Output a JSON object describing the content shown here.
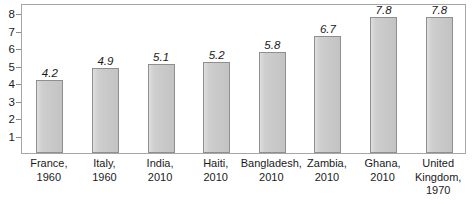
{
  "chart_data": {
    "type": "bar",
    "title": "",
    "subtitle": "",
    "xlabel": "",
    "ylabel": "",
    "ylim": [
      0,
      8.6
    ],
    "yticks": [
      1,
      2,
      3,
      4,
      5,
      6,
      7,
      8
    ],
    "grid": false,
    "legend": null,
    "value_labels_shown": true,
    "value_label_style": "italic",
    "bar_fill_color": "#c9c9c9",
    "bar_border_color": "#8f8f8f",
    "axis_color": "#a6a6a6",
    "text_color": "#1a1a1a",
    "categories": [
      "France, 1960",
      "Italy, 1960",
      "India, 2010",
      "Haiti, 2010",
      "Bangladesh, 2010",
      "Zambia, 2010",
      "Ghana, 2010",
      "United Kingdom, 1970"
    ],
    "category_lines": [
      [
        "France,",
        "1960"
      ],
      [
        "Italy,",
        "1960"
      ],
      [
        "India,",
        "2010"
      ],
      [
        "Haiti,",
        "2010"
      ],
      [
        "Bangladesh,",
        "2010"
      ],
      [
        "Zambia,",
        "2010"
      ],
      [
        "Ghana,",
        "2010"
      ],
      [
        "United",
        "Kingdom,",
        "1970"
      ]
    ],
    "values": [
      4.2,
      4.9,
      5.1,
      5.2,
      5.8,
      6.7,
      7.8,
      7.8
    ],
    "value_labels": [
      "4.2",
      "4.9",
      "5.1",
      "5.2",
      "5.8",
      "6.7",
      "7.8",
      "7.8"
    ],
    "ytick_labels": [
      "8",
      "7",
      "6",
      "5",
      "4",
      "3",
      "2",
      "1"
    ]
  }
}
